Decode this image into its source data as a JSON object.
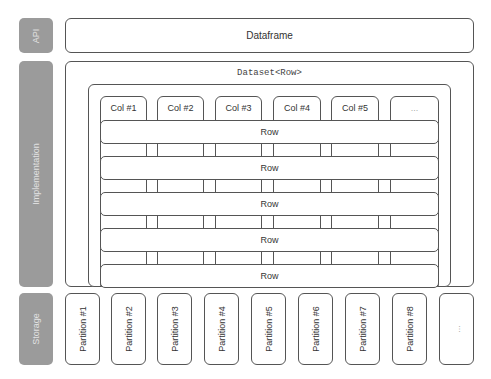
{
  "layers": {
    "api": "API",
    "implementation": "Implementation",
    "storage": "Storage"
  },
  "dataframe": {
    "label": "Dataframe"
  },
  "dataset": {
    "label": "Dataset<Row>"
  },
  "columns": [
    "Col #1",
    "Col #2",
    "Col #3",
    "Col #4",
    "Col #5",
    "..."
  ],
  "rows": [
    "Row",
    "Row",
    "Row",
    "Row",
    "Row"
  ],
  "partitions": [
    "Partition #1",
    "Partition #2",
    "Partition #3",
    "Partition #4",
    "Partition #5",
    "Partition #6",
    "Partition #7",
    "Partition #8",
    "..."
  ],
  "colors": {
    "label_bg": "#9b9b9b",
    "label_text": "#e2e2e2",
    "border": "#555555"
  }
}
